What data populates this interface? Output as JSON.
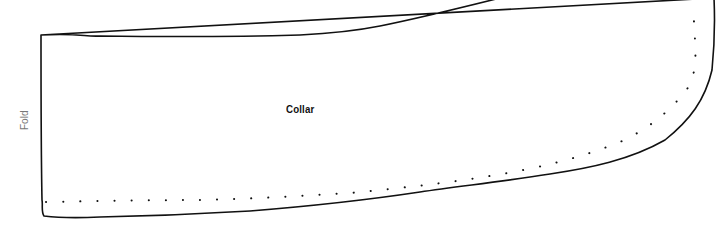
{
  "diagram": {
    "type": "sewing-pattern-piece",
    "piece_label": "Collar",
    "fold_label": "Fold",
    "colors": {
      "background": "#ffffff",
      "outline": "#111111",
      "seam_dots": "#111111",
      "fold_text": "#777777",
      "label_text": "#111111"
    },
    "elements": [
      {
        "name": "cut-line",
        "style": "solid",
        "description": "outer cutting outline"
      },
      {
        "name": "seam-line",
        "style": "dotted",
        "description": "stitching line inside outline"
      },
      {
        "name": "fold-edge",
        "side": "left",
        "description": "straight left edge placed on fold"
      }
    ]
  }
}
